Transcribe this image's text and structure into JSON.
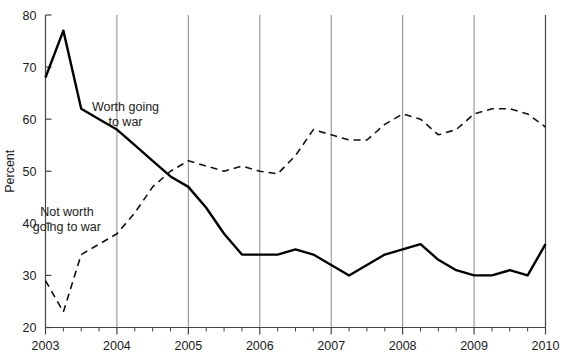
{
  "chart_data": {
    "type": "line",
    "title": "",
    "subtitle": "",
    "xlabel": "",
    "ylabel": "Percent",
    "xlim": [
      2003.0,
      2010.0
    ],
    "ylim": [
      20,
      80
    ],
    "y_ticks": [
      20,
      30,
      40,
      50,
      60,
      70,
      80
    ],
    "y_tick_labels": [
      "20",
      "30",
      "40",
      "50",
      "60",
      "70",
      "80"
    ],
    "x_ticks": [
      2003,
      2004,
      2005,
      2006,
      2007,
      2008,
      2009,
      2010
    ],
    "x_tick_labels": [
      "2003",
      "2004",
      "2005",
      "2006",
      "2007",
      "2008",
      "2009",
      "2010"
    ],
    "x_minor_tick_interval": 0.25,
    "grid": "vertical-major-only",
    "grid_color": "#888888",
    "legend": "inline-annotations",
    "annotations": [
      {
        "text_line1": "Worth going",
        "text_line2": "to war",
        "series": "Worth going to war",
        "x": 2004.12,
        "y": 61.5
      },
      {
        "text_line1": "Not worth",
        "text_line2": "going to war",
        "series": "Not worth going to war",
        "x": 2003.3,
        "y": 41.5
      }
    ],
    "series": [
      {
        "name": "Worth going to war",
        "style": "solid",
        "color": "#000000",
        "line_width": 2.4,
        "x": [
          2003.0,
          2003.25,
          2003.5,
          2003.75,
          2004.0,
          2004.25,
          2004.5,
          2004.75,
          2005.0,
          2005.25,
          2005.5,
          2005.75,
          2006.0,
          2006.25,
          2006.5,
          2006.75,
          2007.0,
          2007.25,
          2007.5,
          2007.75,
          2008.0,
          2008.25,
          2008.5,
          2008.75,
          2009.0,
          2009.25,
          2009.5,
          2009.75,
          2010.0
        ],
        "values": [
          68,
          77,
          62,
          60,
          58,
          55,
          52,
          49,
          47,
          43,
          38,
          34,
          34,
          34,
          35,
          34,
          32,
          30,
          32,
          34,
          35,
          36,
          33,
          31,
          30,
          30,
          31,
          30,
          36
        ]
      },
      {
        "name": "Not worth going to war",
        "style": "dashed",
        "color": "#111111",
        "line_width": 1.6,
        "dash_pattern": "7,5",
        "x": [
          2003.0,
          2003.25,
          2003.5,
          2003.75,
          2004.0,
          2004.25,
          2004.5,
          2004.75,
          2005.0,
          2005.25,
          2005.5,
          2005.75,
          2006.0,
          2006.25,
          2006.5,
          2006.75,
          2007.0,
          2007.25,
          2007.5,
          2007.75,
          2008.0,
          2008.25,
          2008.5,
          2008.75,
          2009.0,
          2009.25,
          2009.5,
          2009.75,
          2010.0
        ],
        "values": [
          29,
          23,
          34,
          36,
          38,
          42,
          47,
          50,
          52,
          51,
          50,
          51,
          50,
          49.5,
          53,
          58,
          57,
          56,
          56,
          59,
          61,
          60,
          57,
          58,
          61,
          62,
          62,
          61,
          58.5
        ]
      }
    ]
  }
}
